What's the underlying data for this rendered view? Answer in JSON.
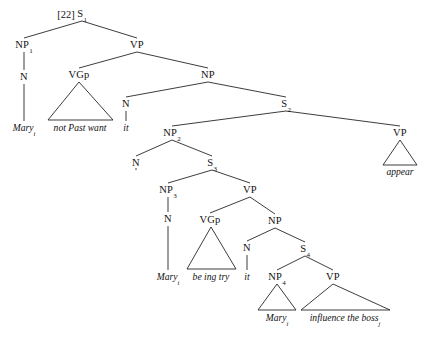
{
  "figure": {
    "example_number": "[22]",
    "type": "syntax-tree",
    "line_color": "#1a1a1a",
    "background_color": "#ffffff",
    "text_color": "#111111"
  },
  "nodes": [
    {
      "id": "s1",
      "label": "S",
      "sub": "1",
      "x": 82,
      "y": 14
    },
    {
      "id": "np1",
      "label": "NP",
      "sub": "1",
      "x": 24,
      "y": 45
    },
    {
      "id": "vp1",
      "label": "VP",
      "sub": "",
      "x": 137,
      "y": 45
    },
    {
      "id": "n1",
      "label": "N",
      "sub": "",
      "x": 24,
      "y": 77
    },
    {
      "id": "vgp1",
      "label": "VGp",
      "sub": "",
      "x": 79,
      "y": 75
    },
    {
      "id": "np2a",
      "label": "NP",
      "sub": "",
      "x": 208,
      "y": 75
    },
    {
      "id": "n2",
      "label": "N",
      "sub": "",
      "x": 126,
      "y": 104
    },
    {
      "id": "s2",
      "label": "S",
      "sub": "2",
      "x": 286,
      "y": 104
    },
    {
      "id": "np2",
      "label": "NP",
      "sub": "2",
      "x": 172,
      "y": 133
    },
    {
      "id": "vp2",
      "label": "VP",
      "sub": "",
      "x": 400,
      "y": 133
    },
    {
      "id": "n3",
      "label": "N",
      "sub": "",
      "x": 136,
      "y": 163
    },
    {
      "id": "s3",
      "label": "S",
      "sub": "3",
      "x": 212,
      "y": 163
    },
    {
      "id": "np3",
      "label": "NP",
      "sub": "3",
      "x": 168,
      "y": 190
    },
    {
      "id": "vp3",
      "label": "VP",
      "sub": "",
      "x": 250,
      "y": 190
    },
    {
      "id": "n4",
      "label": "N",
      "sub": "",
      "x": 168,
      "y": 219
    },
    {
      "id": "vgp2",
      "label": "VGp",
      "sub": "",
      "x": 210,
      "y": 220
    },
    {
      "id": "np4a",
      "label": "NP",
      "sub": "",
      "x": 275,
      "y": 221
    },
    {
      "id": "n5",
      "label": "N",
      "sub": "",
      "x": 247,
      "y": 248
    },
    {
      "id": "s4",
      "label": "S",
      "sub": "4",
      "x": 305,
      "y": 249
    },
    {
      "id": "np4",
      "label": "NP",
      "sub": "4",
      "x": 277,
      "y": 277
    },
    {
      "id": "vp4",
      "label": "VP",
      "sub": "",
      "x": 333,
      "y": 277
    }
  ],
  "leaves": [
    {
      "id": "mary-1",
      "text": "Mary",
      "sub": "i",
      "x": 24,
      "y": 128
    },
    {
      "id": "vgp1-text",
      "text": "not Past want",
      "sub": "",
      "x": 80,
      "y": 128
    },
    {
      "id": "it-1",
      "text": "it",
      "sub": "",
      "x": 126,
      "y": 128
    },
    {
      "id": "appear",
      "text": "appear",
      "sub": "",
      "x": 400,
      "y": 172
    },
    {
      "id": "mary-2",
      "text": "Mary",
      "sub": "i",
      "x": 168,
      "y": 277
    },
    {
      "id": "vgp2-text",
      "text": "be ing try",
      "sub": "",
      "x": 211,
      "y": 277
    },
    {
      "id": "it-2",
      "text": "it",
      "sub": "",
      "x": 247,
      "y": 277
    },
    {
      "id": "mary-3",
      "text": "Mary",
      "sub": "i",
      "x": 277,
      "y": 318
    },
    {
      "id": "vp4-text",
      "text": "influence the boss",
      "sub": "j",
      "x": 345,
      "y": 318
    }
  ],
  "branches": [
    {
      "from": "s1",
      "to": "np1"
    },
    {
      "from": "s1",
      "to": "vp1"
    },
    {
      "from": "np1",
      "to": "n1"
    },
    {
      "from": "n1",
      "to": "mary-1"
    },
    {
      "from": "vp1",
      "to": "vgp1"
    },
    {
      "from": "vp1",
      "to": "np2a"
    },
    {
      "from": "np2a",
      "to": "n2"
    },
    {
      "from": "np2a",
      "to": "s2"
    },
    {
      "from": "n2",
      "to": "it-1"
    },
    {
      "from": "s2",
      "to": "np2"
    },
    {
      "from": "s2",
      "to": "vp2"
    },
    {
      "from": "np2",
      "to": "n3"
    },
    {
      "from": "np2",
      "to": "s3"
    },
    {
      "from": "n3",
      "to": "it-2-upper"
    },
    {
      "from": "s3",
      "to": "np3"
    },
    {
      "from": "s3",
      "to": "vp3"
    },
    {
      "from": "np3",
      "to": "n4"
    },
    {
      "from": "n4",
      "to": "mary-2"
    },
    {
      "from": "vp3",
      "to": "vgp2"
    },
    {
      "from": "vp3",
      "to": "np4a"
    },
    {
      "from": "np4a",
      "to": "n5"
    },
    {
      "from": "np4a",
      "to": "s4"
    },
    {
      "from": "n5",
      "to": "it-2"
    },
    {
      "from": "s4",
      "to": "np4"
    },
    {
      "from": "s4",
      "to": "vp4"
    }
  ],
  "triangles": [
    {
      "id": "vgp1-triangle",
      "apex_x": 79,
      "apex_y": 82,
      "base_y": 120,
      "base_left": 48,
      "base_right": 113
    },
    {
      "id": "vp2-triangle",
      "apex_x": 400,
      "apex_y": 140,
      "base_y": 165,
      "base_left": 383,
      "base_right": 417
    },
    {
      "id": "vgp2-triangle",
      "apex_x": 211,
      "apex_y": 227,
      "base_y": 269,
      "base_left": 187,
      "base_right": 236
    },
    {
      "id": "np4-triangle",
      "apex_x": 277,
      "apex_y": 284,
      "base_y": 310,
      "base_left": 258,
      "base_right": 296
    },
    {
      "id": "vp4-triangle",
      "apex_x": 333,
      "apex_y": 284,
      "base_y": 310,
      "base_left": 301,
      "base_right": 390
    }
  ]
}
